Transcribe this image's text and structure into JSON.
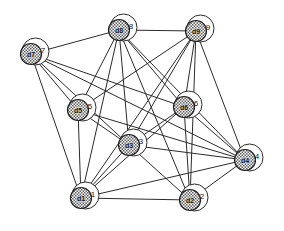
{
  "figure": {
    "kind": "undirected-network-graph",
    "background_color": "#ffffff",
    "edge_color": "#2b2b2b",
    "node_fill_color": "#ffffff",
    "node_hatch_color": "#6e6e6e",
    "node_stroke_color": "#2b2b2b",
    "width": 284,
    "height": 231
  },
  "chart_data": {
    "type": "scatter",
    "title": "",
    "xlabel": "",
    "ylabel": "",
    "nodes": [
      {
        "id": "d1",
        "index": "1",
        "x": 81,
        "y": 198,
        "r": 13.5
      },
      {
        "id": "d2",
        "index": "2",
        "x": 190,
        "y": 200,
        "r": 13.5
      },
      {
        "id": "d3",
        "index": "3",
        "x": 129,
        "y": 145,
        "r": 13.5
      },
      {
        "id": "d4",
        "index": "4",
        "x": 245,
        "y": 160,
        "r": 13.5
      },
      {
        "id": "d5",
        "index": "5",
        "x": 78,
        "y": 110,
        "r": 13.5
      },
      {
        "id": "d6",
        "index": "6",
        "x": 184,
        "y": 107,
        "r": 13.5
      },
      {
        "id": "d7",
        "index": "7",
        "x": 31,
        "y": 54,
        "r": 13.5
      },
      {
        "id": "d8",
        "index": "8",
        "x": 119,
        "y": 30,
        "r": 13.5
      },
      {
        "id": "d9",
        "index": "9",
        "x": 196,
        "y": 31,
        "r": 13.5
      }
    ],
    "edges": [
      {
        "source": "d7",
        "target": "d8"
      },
      {
        "source": "d7",
        "target": "d5"
      },
      {
        "source": "d7",
        "target": "d1"
      },
      {
        "source": "d7",
        "target": "d3"
      },
      {
        "source": "d7",
        "target": "d6"
      },
      {
        "source": "d7",
        "target": "d4"
      },
      {
        "source": "d8",
        "target": "d9"
      },
      {
        "source": "d8",
        "target": "d5"
      },
      {
        "source": "d8",
        "target": "d3"
      },
      {
        "source": "d8",
        "target": "d1"
      },
      {
        "source": "d8",
        "target": "d2"
      },
      {
        "source": "d8",
        "target": "d4"
      },
      {
        "source": "d8",
        "target": "d6"
      },
      {
        "source": "d9",
        "target": "d5"
      },
      {
        "source": "d9",
        "target": "d3"
      },
      {
        "source": "d9",
        "target": "d1"
      },
      {
        "source": "d9",
        "target": "d6"
      },
      {
        "source": "d9",
        "target": "d4"
      },
      {
        "source": "d9",
        "target": "d2"
      },
      {
        "source": "d5",
        "target": "d3"
      },
      {
        "source": "d5",
        "target": "d1"
      },
      {
        "source": "d5",
        "target": "d4"
      },
      {
        "source": "d6",
        "target": "d3"
      },
      {
        "source": "d6",
        "target": "d1"
      },
      {
        "source": "d6",
        "target": "d2"
      },
      {
        "source": "d6",
        "target": "d4"
      },
      {
        "source": "d3",
        "target": "d1"
      },
      {
        "source": "d3",
        "target": "d2"
      },
      {
        "source": "d3",
        "target": "d4"
      },
      {
        "source": "d1",
        "target": "d2"
      },
      {
        "source": "d1",
        "target": "d4"
      },
      {
        "source": "d2",
        "target": "d4"
      }
    ],
    "node_count": 9,
    "edge_count": 32
  }
}
